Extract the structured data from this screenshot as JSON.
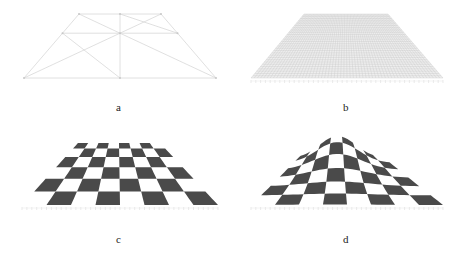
{
  "figure": {
    "panels": [
      {
        "id": "a",
        "label": "a",
        "description": "sparse wireframe mesh"
      },
      {
        "id": "b",
        "label": "b",
        "description": "dense grid mesh"
      },
      {
        "id": "c",
        "label": "c",
        "description": "flat checkerboard texture"
      },
      {
        "id": "d",
        "label": "d",
        "description": "deformed checkerboard texture"
      }
    ],
    "colors": {
      "dark_square": "#4a4a4a",
      "light_square": "#ffffff",
      "wire": "#d8d8d8",
      "dense_grid": "#c4c4c4",
      "label": "#222222"
    },
    "board": {
      "rows": 6,
      "cols": 8
    }
  }
}
